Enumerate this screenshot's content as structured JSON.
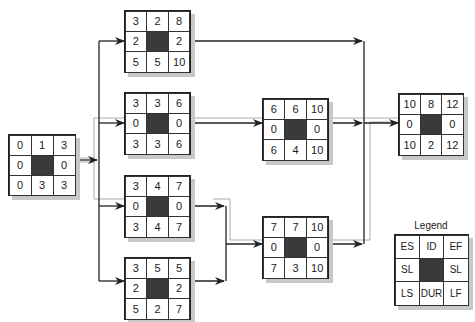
{
  "diagram": {
    "type": "activity-on-node network",
    "nodes": [
      {
        "id": "A",
        "es": "0",
        "dur_top": "1",
        "ef": "3",
        "sl_left": "0",
        "sl_right": "0",
        "ls": "0",
        "dur": "3",
        "lf": "3",
        "x": 8,
        "y": 134
      },
      {
        "id": "B",
        "es": "3",
        "dur_top": "2",
        "ef": "8",
        "sl_left": "2",
        "sl_right": "2",
        "ls": "5",
        "dur": "5",
        "lf": "10",
        "x": 124,
        "y": 10
      },
      {
        "id": "C",
        "es": "3",
        "dur_top": "3",
        "ef": "6",
        "sl_left": "0",
        "sl_right": "0",
        "ls": "3",
        "dur": "3",
        "lf": "6",
        "x": 124,
        "y": 92
      },
      {
        "id": "D",
        "es": "3",
        "dur_top": "4",
        "ef": "7",
        "sl_left": "0",
        "sl_right": "0",
        "ls": "3",
        "dur": "4",
        "lf": "7",
        "x": 124,
        "y": 175
      },
      {
        "id": "E",
        "es": "3",
        "dur_top": "5",
        "ef": "5",
        "sl_left": "2",
        "sl_right": "2",
        "ls": "5",
        "dur": "2",
        "lf": "7",
        "x": 124,
        "y": 257
      },
      {
        "id": "F",
        "es": "6",
        "dur_top": "6",
        "ef": "10",
        "sl_left": "0",
        "sl_right": "0",
        "ls": "6",
        "dur": "4",
        "lf": "10",
        "x": 262,
        "y": 98
      },
      {
        "id": "G",
        "es": "7",
        "dur_top": "7",
        "ef": "10",
        "sl_left": "0",
        "sl_right": "0",
        "ls": "7",
        "dur": "3",
        "lf": "10",
        "x": 262,
        "y": 216
      },
      {
        "id": "H",
        "es": "10",
        "dur_top": "8",
        "ef": "12",
        "sl_left": "0",
        "sl_right": "0",
        "ls": "10",
        "dur": "2",
        "lf": "12",
        "x": 398,
        "y": 93
      }
    ],
    "edges": [
      {
        "from": "A",
        "to": "B"
      },
      {
        "from": "A",
        "to": "C"
      },
      {
        "from": "A",
        "to": "D"
      },
      {
        "from": "A",
        "to": "E"
      },
      {
        "from": "B",
        "to": "H"
      },
      {
        "from": "C",
        "to": "F"
      },
      {
        "from": "D",
        "to": "G"
      },
      {
        "from": "E",
        "to": "G"
      },
      {
        "from": "F",
        "to": "H"
      },
      {
        "from": "G",
        "to": "H"
      }
    ],
    "critical_path": [
      "A",
      "C",
      "F",
      "H"
    ],
    "legend": {
      "title": "Legend",
      "cells": [
        "ES",
        "ID",
        "EF",
        "SL",
        "",
        "SL",
        "LS",
        "DUR",
        "LF"
      ]
    }
  }
}
